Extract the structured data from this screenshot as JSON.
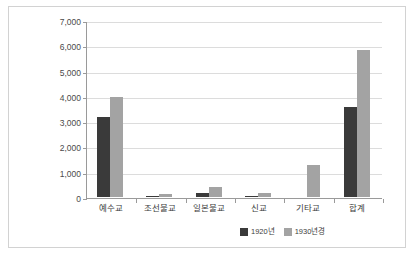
{
  "chart_data": {
    "type": "bar",
    "title": "",
    "subtitle": "",
    "xlabel": "",
    "ylabel": "",
    "categories": [
      "예수교",
      "조선불교",
      "일본불교",
      "신교",
      "기타교",
      "합계"
    ],
    "series": [
      {
        "name": "1920년",
        "color": "#3a3a3a",
        "values": [
          3180,
          55,
          160,
          50,
          0,
          3570
        ]
      },
      {
        "name": "1930년경",
        "color": "#a3a3a3",
        "values": [
          3960,
          105,
          390,
          170,
          1250,
          5830
        ]
      }
    ],
    "ylim": [
      0,
      7000
    ],
    "ytick_values": [
      0,
      1000,
      2000,
      3000,
      4000,
      5000,
      6000,
      7000
    ],
    "ytick_labels": [
      "0",
      "1,000",
      "2,000",
      "3,000",
      "4,000",
      "5,000",
      "6,000",
      "7,000"
    ],
    "grid": true,
    "legend_position": "bottom-right",
    "legend_entries": [
      "1920년",
      "1930년경"
    ],
    "annotations": []
  },
  "colors": {
    "series_1920": "#3a3a3a",
    "series_1930": "#a3a3a3",
    "axis": "#9a9a9a",
    "grid": "#dcdcdc",
    "frame": "#d2d2d2",
    "background": "#ffffff"
  }
}
